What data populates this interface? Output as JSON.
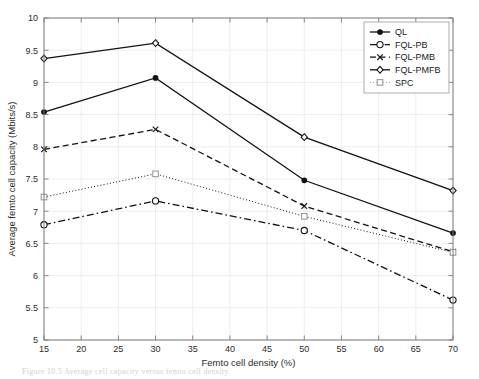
{
  "figure": {
    "caption": "Figure 10.5  Average cell capacity versus femto cell density."
  },
  "chart_data": {
    "type": "line",
    "title": "",
    "xlabel": "Femto cell density (%)",
    "ylabel": "Average femto cell capacity (Mbits/s)",
    "x": [
      15,
      30,
      50,
      70
    ],
    "xlim": [
      15,
      70
    ],
    "ylim": [
      5,
      10
    ],
    "xticks": [
      15,
      20,
      25,
      30,
      35,
      40,
      45,
      50,
      55,
      60,
      65,
      70
    ],
    "xtick_labels": [
      "15",
      "20",
      "25",
      "30",
      "35",
      "40",
      "45",
      "50",
      "55",
      "60",
      "65",
      "70"
    ],
    "yticks": [
      5,
      5.5,
      6,
      6.5,
      7,
      7.5,
      8,
      8.5,
      9,
      9.5,
      10
    ],
    "ytick_labels": [
      "5",
      "5.5",
      "6",
      "6.5",
      "7",
      "7.5",
      "8",
      "8.5",
      "9",
      "9.5",
      "10"
    ],
    "grid": true,
    "legend_position": "top-right",
    "series": [
      {
        "name": "QL",
        "values": [
          8.54,
          9.07,
          7.48,
          6.66
        ],
        "marker": "filled-circle",
        "dash": "solid",
        "color": "#111111"
      },
      {
        "name": "FQL-PB",
        "values": [
          6.79,
          7.16,
          6.7,
          5.62
        ],
        "marker": "open-circle",
        "dash": "dash-dot",
        "color": "#111111"
      },
      {
        "name": "FQL-PMB",
        "values": [
          7.96,
          8.27,
          7.08,
          6.37
        ],
        "marker": "cross-x",
        "dash": "dashed",
        "color": "#111111"
      },
      {
        "name": "FQL-PMFB",
        "values": [
          9.37,
          9.61,
          8.15,
          7.32
        ],
        "marker": "open-diamond",
        "dash": "solid",
        "color": "#111111"
      },
      {
        "name": "SPC",
        "values": [
          7.22,
          7.58,
          6.92,
          6.36
        ],
        "marker": "open-square",
        "dash": "dotted",
        "color": "#9a9a9a"
      }
    ]
  }
}
